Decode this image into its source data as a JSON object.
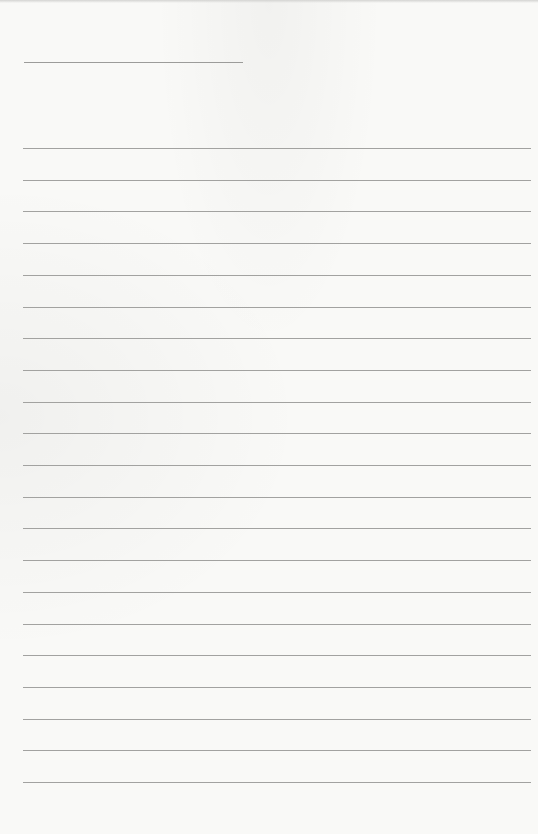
{
  "document": {
    "type": "lined-paper",
    "background_color": "#f9f9f7",
    "line_color": "#a2a2a0",
    "header_line": {
      "label": "",
      "x": 24,
      "y": 62,
      "width": 219
    },
    "ruled_lines": {
      "count": 21,
      "first_y": 148,
      "spacing": 31.7,
      "x": 23,
      "width": 508
    }
  }
}
